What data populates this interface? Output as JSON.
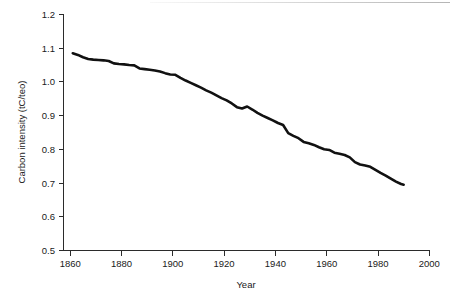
{
  "chart_data": {
    "type": "line",
    "title": "",
    "subtitle": "",
    "xlabel": "Year",
    "ylabel": "Carbon intensity (tC/teo)",
    "xlim": [
      1850,
      2005
    ],
    "ylim": [
      0.5,
      1.2
    ],
    "x_ticks": [
      1860,
      1880,
      1900,
      1920,
      1940,
      1960,
      1980,
      2000
    ],
    "x_tick_labels": [
      "1860",
      "1880",
      "1900",
      "1920",
      "1940",
      "1960",
      "1980",
      "2000"
    ],
    "y_ticks": [
      0.5,
      0.6,
      0.7,
      0.8,
      0.9,
      1.0,
      1.1,
      1.2
    ],
    "y_tick_labels": [
      "0.5",
      "0.6",
      "0.7",
      "0.8",
      "0.9",
      "1.0",
      "1.1",
      "1.2"
    ],
    "grid": false,
    "legend": false,
    "legend_position": "none",
    "line_color": "#111111",
    "series": [
      {
        "name": "Carbon intensity",
        "x": [
          1861,
          1863,
          1865,
          1867,
          1869,
          1871,
          1873,
          1875,
          1877,
          1879,
          1881,
          1883,
          1885,
          1887,
          1889,
          1891,
          1893,
          1895,
          1897,
          1899,
          1901,
          1903,
          1905,
          1907,
          1909,
          1911,
          1913,
          1915,
          1917,
          1919,
          1921,
          1923,
          1925,
          1927,
          1929,
          1931,
          1933,
          1935,
          1937,
          1939,
          1941,
          1943,
          1945,
          1947,
          1949,
          1951,
          1953,
          1955,
          1957,
          1959,
          1961,
          1963,
          1965,
          1967,
          1969,
          1971,
          1973,
          1975,
          1977,
          1979,
          1981,
          1983,
          1985,
          1987,
          1989,
          1990
        ],
        "values": [
          1.085,
          1.08,
          1.073,
          1.068,
          1.066,
          1.065,
          1.064,
          1.062,
          1.055,
          1.053,
          1.052,
          1.05,
          1.049,
          1.04,
          1.038,
          1.036,
          1.034,
          1.031,
          1.026,
          1.022,
          1.021,
          1.012,
          1.004,
          0.997,
          0.99,
          0.983,
          0.975,
          0.968,
          0.96,
          0.952,
          0.945,
          0.936,
          0.925,
          0.921,
          0.927,
          0.918,
          0.908,
          0.9,
          0.893,
          0.886,
          0.878,
          0.872,
          0.848,
          0.84,
          0.833,
          0.822,
          0.818,
          0.813,
          0.806,
          0.8,
          0.798,
          0.79,
          0.787,
          0.783,
          0.776,
          0.762,
          0.755,
          0.752,
          0.748,
          0.739,
          0.73,
          0.722,
          0.713,
          0.704,
          0.697,
          0.695
        ]
      }
    ]
  },
  "axes": {
    "y_title": "Carbon intensity (tC/teo)",
    "x_title": "Year"
  }
}
